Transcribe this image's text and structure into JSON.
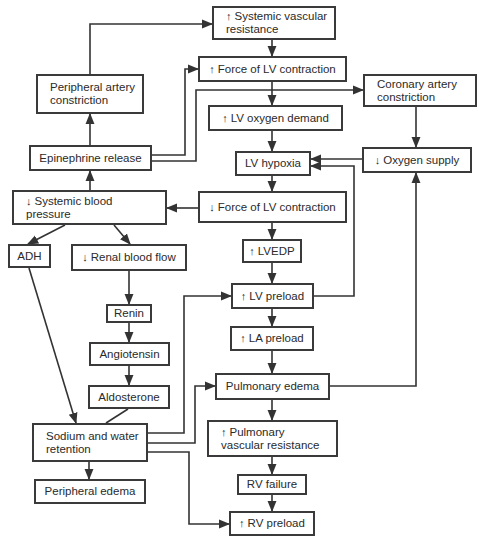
{
  "diagram": {
    "type": "flowchart",
    "topic": "Heart failure pathophysiology",
    "up_arrow": "↑",
    "down_arrow": "↓",
    "nodes": [
      {
        "id": "svr",
        "prefix": "up",
        "label": "Systemic vascular resistance",
        "x": 212,
        "y": 6,
        "w": 124,
        "h": 34,
        "align": "left"
      },
      {
        "id": "pac",
        "prefix": "",
        "label": "Peripheral artery constriction",
        "x": 36,
        "y": 74,
        "w": 108,
        "h": 40,
        "align": "left"
      },
      {
        "id": "flvc_up",
        "prefix": "up",
        "label": "Force of LV contraction",
        "x": 198,
        "y": 56,
        "w": 149,
        "h": 26,
        "align": "center"
      },
      {
        "id": "cac",
        "prefix": "",
        "label": "Coronary artery constriction",
        "x": 363,
        "y": 74,
        "w": 114,
        "h": 33,
        "align": "left"
      },
      {
        "id": "lvod",
        "prefix": "up",
        "label": "LV oxygen demand",
        "x": 208,
        "y": 105,
        "w": 135,
        "h": 26,
        "align": "center"
      },
      {
        "id": "epi",
        "prefix": "",
        "label": "Epinephrine release",
        "x": 29,
        "y": 145,
        "w": 123,
        "h": 26,
        "align": "center"
      },
      {
        "id": "lvh",
        "prefix": "",
        "label": "LV hypoxia",
        "x": 235,
        "y": 151,
        "w": 76,
        "h": 25,
        "align": "center"
      },
      {
        "id": "o2",
        "prefix": "down",
        "label": "Oxygen supply",
        "x": 362,
        "y": 147,
        "w": 110,
        "h": 26,
        "align": "center"
      },
      {
        "id": "sbp",
        "prefix": "down",
        "label": "Systemic blood pressure",
        "x": 12,
        "y": 190,
        "w": 155,
        "h": 35,
        "align": "left"
      },
      {
        "id": "flvc_down",
        "prefix": "down",
        "label": "Force of LV contraction",
        "x": 198,
        "y": 191,
        "w": 149,
        "h": 32,
        "align": "center"
      },
      {
        "id": "adh",
        "prefix": "",
        "label": "ADH",
        "x": 8,
        "y": 244,
        "w": 43,
        "h": 24,
        "align": "center"
      },
      {
        "id": "rbf",
        "prefix": "down",
        "label": "Renal blood flow",
        "x": 71,
        "y": 244,
        "w": 116,
        "h": 27,
        "align": "center"
      },
      {
        "id": "lvedp",
        "prefix": "up",
        "label": "LVEDP",
        "x": 242,
        "y": 239,
        "w": 60,
        "h": 24,
        "align": "center"
      },
      {
        "id": "lvp",
        "prefix": "up",
        "label": "LV preload",
        "x": 231,
        "y": 283,
        "w": 83,
        "h": 26,
        "align": "center"
      },
      {
        "id": "renin",
        "prefix": "",
        "label": "Renin",
        "x": 106,
        "y": 304,
        "w": 46,
        "h": 19,
        "align": "center"
      },
      {
        "id": "lap",
        "prefix": "up",
        "label": "LA preload",
        "x": 230,
        "y": 326,
        "w": 84,
        "h": 25,
        "align": "center"
      },
      {
        "id": "ang",
        "prefix": "",
        "label": "Angiotensin",
        "x": 89,
        "y": 342,
        "w": 81,
        "h": 24,
        "align": "center"
      },
      {
        "id": "pe",
        "prefix": "",
        "label": "Pulmonary edema",
        "x": 215,
        "y": 373,
        "w": 115,
        "h": 27,
        "align": "center"
      },
      {
        "id": "ald",
        "prefix": "",
        "label": "Aldosterone",
        "x": 88,
        "y": 385,
        "w": 82,
        "h": 24,
        "align": "center"
      },
      {
        "id": "swr",
        "prefix": "",
        "label": "Sodium and water retention",
        "x": 32,
        "y": 423,
        "w": 116,
        "h": 39,
        "align": "left"
      },
      {
        "id": "pvr",
        "prefix": "up",
        "label": "Pulmonary vascular resistance",
        "x": 207,
        "y": 420,
        "w": 131,
        "h": 37,
        "align": "left"
      },
      {
        "id": "ped",
        "prefix": "",
        "label": "Peripheral edema",
        "x": 34,
        "y": 479,
        "w": 112,
        "h": 25,
        "align": "center"
      },
      {
        "id": "rvf",
        "prefix": "",
        "label": "RV failure",
        "x": 237,
        "y": 474,
        "w": 70,
        "h": 21,
        "align": "center"
      },
      {
        "id": "rvp",
        "prefix": "up",
        "label": "RV preload",
        "x": 229,
        "y": 511,
        "w": 86,
        "h": 25,
        "align": "center"
      }
    ],
    "edges": [
      {
        "from": "pac",
        "to": "svr",
        "points": "90,74 90,24 212,24",
        "arrow": true
      },
      {
        "from": "epi",
        "to": "pac",
        "points": "90,145 90,114",
        "arrow": true
      },
      {
        "from": "epi",
        "to": "flvc_up",
        "points": "152,155 185,155 185,69 198,69",
        "arrow": true
      },
      {
        "from": "epi",
        "to": "cac",
        "points": "152,161 196,161 196,90 363,90",
        "arrow": true
      },
      {
        "from": "svr",
        "to": "flvc_up",
        "points": "272,40 272,56",
        "arrow": true
      },
      {
        "from": "flvc_up",
        "to": "lvod",
        "points": "272,82 272,105",
        "arrow": true
      },
      {
        "from": "lvod",
        "to": "lvh",
        "points": "272,131 272,151",
        "arrow": true
      },
      {
        "from": "cac",
        "to": "o2",
        "points": "416,107 416,147",
        "arrow": true
      },
      {
        "from": "o2",
        "to": "lvh",
        "points": "362,159 311,159",
        "arrow": true
      },
      {
        "from": "lvp",
        "to": "lvh",
        "points": "314,296 354,296 354,166 311,166",
        "arrow": true
      },
      {
        "from": "sbp",
        "to": "epi",
        "points": "90,190 90,171",
        "arrow": true
      },
      {
        "from": "lvh",
        "to": "flvc_down",
        "points": "272,176 272,191",
        "arrow": true
      },
      {
        "from": "flvc_down",
        "to": "sbp",
        "points": "198,208 167,208",
        "arrow": true
      },
      {
        "from": "sbp",
        "to": "adh",
        "points": "65,225 28,244",
        "arrow": true
      },
      {
        "from": "sbp",
        "to": "rbf",
        "points": "114,225 130,244",
        "arrow": true
      },
      {
        "from": "flvc_down",
        "to": "lvedp",
        "points": "272,223 272,239",
        "arrow": true
      },
      {
        "from": "lvedp",
        "to": "lvp",
        "points": "272,263 272,283",
        "arrow": true
      },
      {
        "from": "rbf",
        "to": "renin",
        "points": "129,271 129,304",
        "arrow": true
      },
      {
        "from": "lvp",
        "to": "lap",
        "points": "272,309 272,326",
        "arrow": true
      },
      {
        "from": "renin",
        "to": "ang",
        "points": "129,323 129,342",
        "arrow": true
      },
      {
        "from": "lap",
        "to": "pe",
        "points": "272,351 272,373",
        "arrow": true
      },
      {
        "from": "ang",
        "to": "ald",
        "points": "129,366 129,385",
        "arrow": true
      },
      {
        "from": "pe",
        "to": "o2",
        "points": "330,386 416,386 416,173",
        "arrow": true
      },
      {
        "from": "adh",
        "to": "swr",
        "points": "29,268 76,423",
        "arrow": true
      },
      {
        "from": "ald",
        "to": "swr",
        "points": "128,409 106,423",
        "arrow": false
      },
      {
        "from": "swr",
        "to": "lvp",
        "points": "148,433 184,433 184,296 231,296",
        "arrow": true
      },
      {
        "from": "swr",
        "to": "pe",
        "points": "148,443 195,443 195,386 215,386",
        "arrow": true
      },
      {
        "from": "pe",
        "to": "pvr",
        "points": "272,400 272,420",
        "arrow": true
      },
      {
        "from": "swr",
        "to": "ped",
        "points": "89,462 89,479",
        "arrow": true
      },
      {
        "from": "pvr",
        "to": "rvf",
        "points": "272,457 272,474",
        "arrow": true
      },
      {
        "from": "rvf",
        "to": "rvp",
        "points": "272,495 272,511",
        "arrow": true
      },
      {
        "from": "swr",
        "to": "rvp",
        "points": "148,452 189,452 189,524 229,524",
        "arrow": true
      }
    ]
  }
}
